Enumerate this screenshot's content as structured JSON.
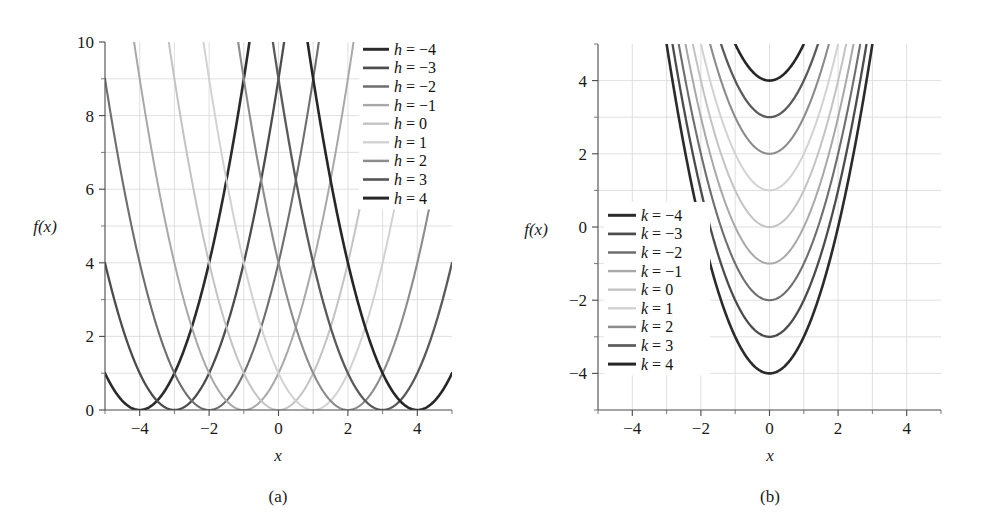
{
  "figure": {
    "background_color": "#ffffff",
    "panels": [
      {
        "id": "a",
        "caption": "(a)",
        "xlabel": "x",
        "ylabel": "f(x)",
        "legend_position": "top-right"
      },
      {
        "id": "b",
        "caption": "(b)",
        "xlabel": "x",
        "ylabel": "f(x)",
        "legend_position": "center-left"
      }
    ]
  },
  "chart_data": [
    {
      "type": "line",
      "panel": "a",
      "title": "",
      "caption": "(a)",
      "xlabel": "x",
      "ylabel": "f(x)",
      "xlim": [
        -5,
        5
      ],
      "ylim": [
        0,
        10
      ],
      "xticks": [
        -4,
        -2,
        0,
        2,
        4
      ],
      "xticklabels": [
        "−4",
        "−2",
        "0",
        "2",
        "4"
      ],
      "xminorticks": [
        -5,
        -3,
        -1,
        1,
        3,
        5
      ],
      "yticks": [
        0,
        2,
        4,
        6,
        8,
        10
      ],
      "yticklabels": [
        "0",
        "2",
        "4",
        "6",
        "8",
        "10"
      ],
      "yminorticks": [
        1,
        3,
        5,
        7,
        9
      ],
      "grid": true,
      "function": "f(x) = (x - h)^2",
      "parameter": "h",
      "legend_position": "top-right",
      "series": [
        {
          "name": "h = −4",
          "param_symbol": "h",
          "param_value": -4,
          "color": "#2b2b2b",
          "width": 2.6,
          "vertex": [
            -4,
            0
          ]
        },
        {
          "name": "h = −3",
          "param_symbol": "h",
          "param_value": -3,
          "color": "#4c4c4c",
          "width": 2.3,
          "vertex": [
            -3,
            0
          ]
        },
        {
          "name": "h = −2",
          "param_symbol": "h",
          "param_value": -2,
          "color": "#6e6e6e",
          "width": 2.1,
          "vertex": [
            -2,
            0
          ]
        },
        {
          "name": "h = −1",
          "param_symbol": "h",
          "param_value": -1,
          "color": "#a8a8a8",
          "width": 2.0,
          "vertex": [
            -1,
            0
          ]
        },
        {
          "name": "h = 0",
          "param_symbol": "h",
          "param_value": 0,
          "color": "#c3c3c3",
          "width": 2.0,
          "vertex": [
            0,
            0
          ]
        },
        {
          "name": "h = 1",
          "param_symbol": "h",
          "param_value": 1,
          "color": "#d2d2d2",
          "width": 2.0,
          "vertex": [
            1,
            0
          ]
        },
        {
          "name": "h = 2",
          "param_symbol": "h",
          "param_value": 2,
          "color": "#8c8c8c",
          "width": 2.1,
          "vertex": [
            2,
            0
          ]
        },
        {
          "name": "h = 3",
          "param_symbol": "h",
          "param_value": 3,
          "color": "#5a5a5a",
          "width": 2.3,
          "vertex": [
            3,
            0
          ]
        },
        {
          "name": "h = 4",
          "param_symbol": "h",
          "param_value": 4,
          "color": "#262626",
          "width": 2.6,
          "vertex": [
            4,
            0
          ]
        }
      ]
    },
    {
      "type": "line",
      "panel": "b",
      "title": "",
      "caption": "(b)",
      "xlabel": "x",
      "ylabel": "f(x)",
      "xlim": [
        -5,
        5
      ],
      "ylim": [
        -5,
        5
      ],
      "xticks": [
        -4,
        -2,
        0,
        2,
        4
      ],
      "xticklabels": [
        "−4",
        "−2",
        "0",
        "2",
        "4"
      ],
      "xminorticks": [
        -5,
        -3,
        -1,
        1,
        3,
        5
      ],
      "yticks": [
        -4,
        -2,
        0,
        2,
        4
      ],
      "yticklabels": [
        "−4",
        "−2",
        "0",
        "2",
        "4"
      ],
      "yminorticks": [
        -5,
        -3,
        -1,
        1,
        3,
        5
      ],
      "grid": true,
      "function": "f(x) = x^2 + k",
      "parameter": "k",
      "legend_position": "center-left",
      "series": [
        {
          "name": "k = −4",
          "param_symbol": "k",
          "param_value": -4,
          "color": "#2b2b2b",
          "width": 2.6,
          "vertex": [
            0,
            -4
          ]
        },
        {
          "name": "k = −3",
          "param_symbol": "k",
          "param_value": -3,
          "color": "#4c4c4c",
          "width": 2.3,
          "vertex": [
            0,
            -3
          ]
        },
        {
          "name": "k = −2",
          "param_symbol": "k",
          "param_value": -2,
          "color": "#6e6e6e",
          "width": 2.1,
          "vertex": [
            0,
            -2
          ]
        },
        {
          "name": "k = −1",
          "param_symbol": "k",
          "param_value": -1,
          "color": "#a8a8a8",
          "width": 2.0,
          "vertex": [
            0,
            -1
          ]
        },
        {
          "name": "k = 0",
          "param_symbol": "k",
          "param_value": 0,
          "color": "#c3c3c3",
          "width": 2.0,
          "vertex": [
            0,
            0
          ]
        },
        {
          "name": "k = 1",
          "param_symbol": "k",
          "param_value": 1,
          "color": "#d2d2d2",
          "width": 2.0,
          "vertex": [
            0,
            1
          ]
        },
        {
          "name": "k = 2",
          "param_symbol": "k",
          "param_value": 2,
          "color": "#8c8c8c",
          "width": 2.1,
          "vertex": [
            0,
            2
          ]
        },
        {
          "name": "k = 3",
          "param_symbol": "k",
          "param_value": 3,
          "color": "#5a5a5a",
          "width": 2.3,
          "vertex": [
            0,
            3
          ]
        },
        {
          "name": "k = 4",
          "param_symbol": "k",
          "param_value": 4,
          "color": "#262626",
          "width": 2.6,
          "vertex": [
            0,
            4
          ]
        }
      ]
    }
  ]
}
